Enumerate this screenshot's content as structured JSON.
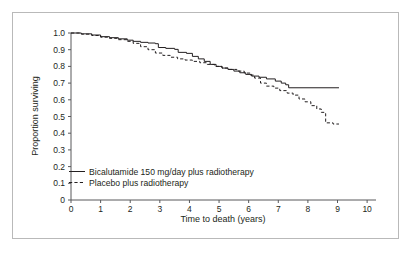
{
  "chart_data": {
    "type": "line",
    "title": "",
    "xlabel": "Time to death (years)",
    "ylabel": "Proportion surviving",
    "xlim": [
      0,
      10.3
    ],
    "ylim": [
      0,
      1.0
    ],
    "grid": false,
    "legend_position": "inside-lower-left",
    "x_ticks": [
      "0",
      "1",
      "2",
      "3",
      "4",
      "5",
      "6",
      "7",
      "8",
      "9",
      "10"
    ],
    "y_ticks": [
      "0",
      "0.1",
      "0.2",
      "0.3",
      "0.4",
      "0.5",
      "0.6",
      "0.7",
      "0.8",
      "0.9",
      "1.0"
    ],
    "series": [
      {
        "name": "Bicalutamide 150 mg/day plus radiotherapy",
        "style": "solid",
        "color": "#231f20",
        "points": [
          [
            0.0,
            1.0
          ],
          [
            0.35,
            0.995
          ],
          [
            0.7,
            0.988
          ],
          [
            1.0,
            0.978
          ],
          [
            1.3,
            0.972
          ],
          [
            1.6,
            0.965
          ],
          [
            1.9,
            0.957
          ],
          [
            2.1,
            0.95
          ],
          [
            2.35,
            0.944
          ],
          [
            2.6,
            0.94
          ],
          [
            2.85,
            0.936
          ],
          [
            2.95,
            0.913
          ],
          [
            3.2,
            0.908
          ],
          [
            3.5,
            0.902
          ],
          [
            3.62,
            0.884
          ],
          [
            3.9,
            0.878
          ],
          [
            4.1,
            0.86
          ],
          [
            4.3,
            0.845
          ],
          [
            4.5,
            0.83
          ],
          [
            4.7,
            0.812
          ],
          [
            4.9,
            0.8
          ],
          [
            5.1,
            0.79
          ],
          [
            5.3,
            0.782
          ],
          [
            5.5,
            0.772
          ],
          [
            5.7,
            0.762
          ],
          [
            5.9,
            0.752
          ],
          [
            6.1,
            0.742
          ],
          [
            6.35,
            0.735
          ],
          [
            6.6,
            0.725
          ],
          [
            6.9,
            0.712
          ],
          [
            7.1,
            0.7
          ],
          [
            7.25,
            0.69
          ],
          [
            7.35,
            0.672
          ],
          [
            9.05,
            0.672
          ]
        ]
      },
      {
        "name": "Placebo plus radiotherapy",
        "style": "dashed",
        "color": "#231f20",
        "points": [
          [
            0.0,
            1.0
          ],
          [
            0.35,
            0.993
          ],
          [
            0.7,
            0.985
          ],
          [
            1.0,
            0.975
          ],
          [
            1.3,
            0.968
          ],
          [
            1.6,
            0.96
          ],
          [
            1.9,
            0.95
          ],
          [
            2.1,
            0.938
          ],
          [
            2.35,
            0.918
          ],
          [
            2.6,
            0.9
          ],
          [
            2.85,
            0.88
          ],
          [
            3.1,
            0.866
          ],
          [
            3.35,
            0.855
          ],
          [
            3.6,
            0.845
          ],
          [
            3.85,
            0.838
          ],
          [
            4.1,
            0.83
          ],
          [
            4.35,
            0.822
          ],
          [
            4.6,
            0.812
          ],
          [
            4.85,
            0.8
          ],
          [
            5.1,
            0.79
          ],
          [
            5.35,
            0.782
          ],
          [
            5.6,
            0.772
          ],
          [
            5.85,
            0.76
          ],
          [
            6.05,
            0.748
          ],
          [
            6.2,
            0.73
          ],
          [
            6.4,
            0.7
          ],
          [
            6.6,
            0.682
          ],
          [
            6.85,
            0.67
          ],
          [
            7.05,
            0.655
          ],
          [
            7.3,
            0.64
          ],
          [
            7.5,
            0.628
          ],
          [
            7.7,
            0.605
          ],
          [
            7.9,
            0.588
          ],
          [
            8.1,
            0.565
          ],
          [
            8.3,
            0.545
          ],
          [
            8.45,
            0.525
          ],
          [
            8.55,
            0.518
          ],
          [
            8.6,
            0.462
          ],
          [
            8.85,
            0.455
          ],
          [
            9.05,
            0.455
          ]
        ]
      }
    ]
  },
  "legend": {
    "items": [
      {
        "label": "Bicalutamide 150 mg/day plus radiotherapy",
        "style": "solid"
      },
      {
        "label": "Placebo plus radiotherapy",
        "style": "dashed"
      }
    ]
  }
}
